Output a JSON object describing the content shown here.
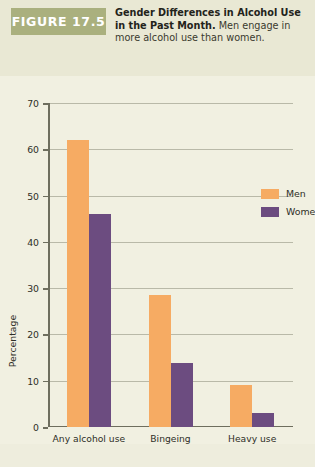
{
  "figure": {
    "badge_label": "FIGURE 17.5",
    "caption_bold": "Gender Differences in Alcohol Use in the Past Month.",
    "caption_rest": " Men engage in more alcohol use than women."
  },
  "colors": {
    "badge_bg": "#aab07e",
    "header_bg": "#e9e8d4",
    "panel_bg": "#f1f0e1",
    "men": "#f6ab63",
    "women": "#6c4c80",
    "axis": "#6e6e5e",
    "grid": "#b9b9a8"
  },
  "legend": {
    "position": "inside-top-right",
    "entries": [
      {
        "label": "Men",
        "color": "#f6ab63"
      },
      {
        "label": "Women",
        "color": "#6c4c80"
      }
    ]
  },
  "chart_data": {
    "type": "bar",
    "title": "Gender Differences in Alcohol Use in the Past Month",
    "categories": [
      "Any alcohol use",
      "Bingeing",
      "Heavy use"
    ],
    "series": [
      {
        "name": "Men",
        "color": "#f6ab63",
        "values": [
          62,
          28.5,
          9
        ]
      },
      {
        "name": "Women",
        "color": "#6c4c80",
        "values": [
          46,
          13.8,
          3
        ]
      }
    ],
    "xlabel": "",
    "ylabel": "Percentage",
    "ylim": [
      0,
      70
    ],
    "yticks": [
      0,
      10,
      20,
      30,
      40,
      50,
      60,
      70
    ],
    "ytick_labels": [
      "0",
      "10",
      "20",
      "30",
      "40",
      "50",
      "60",
      "70"
    ],
    "grid": true,
    "grid_axis": "y",
    "legend_position": "upper right"
  }
}
